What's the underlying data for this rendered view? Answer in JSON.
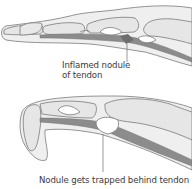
{
  "figure": {
    "panels": [
      {
        "id": "extended-finger",
        "annotation": {
          "line1": "Inflamed nodule",
          "line2": "of tendon"
        }
      },
      {
        "id": "flexed-finger",
        "annotation": {
          "line1": "Nodule gets trapped behind tendon"
        }
      }
    ],
    "colors": {
      "skin_fill": "#efefef",
      "outline": "#7a7a7a",
      "tendon": "#8c8c8c",
      "nodule": "#6e6e6e",
      "bone_fill": "#e6e6e6",
      "sheath": "#ffffff",
      "text": "#3a3a3a"
    }
  }
}
